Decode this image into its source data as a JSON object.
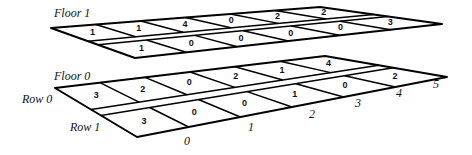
{
  "diagram": {
    "floors": [
      {
        "label": "Floor 1",
        "rows": [
          {
            "row": 0,
            "values": [
              "1",
              "1",
              "4",
              "0",
              "2",
              "2"
            ]
          },
          {
            "row": 1,
            "values": [
              "1",
              "0",
              "0",
              "0",
              "0",
              "3"
            ]
          }
        ]
      },
      {
        "label": "Floor 0",
        "rows": [
          {
            "row": 0,
            "values": [
              "3",
              "2",
              "0",
              "2",
              "1",
              "4"
            ]
          },
          {
            "row": 1,
            "values": [
              "3",
              "0",
              "0",
              "1",
              "0",
              "2"
            ]
          }
        ]
      }
    ],
    "row_labels": [
      "Row 0",
      "Row 1"
    ],
    "column_labels": [
      "0",
      "1",
      "2",
      "3",
      "4",
      "5"
    ]
  }
}
